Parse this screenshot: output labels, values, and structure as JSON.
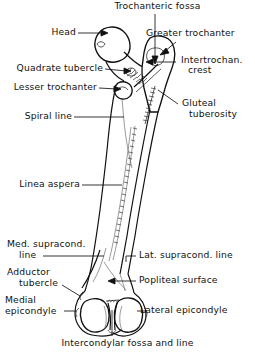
{
  "figure": {
    "view": "posterior",
    "ink_color": "#111111",
    "background_color": "#ffffff"
  },
  "labels": {
    "trochanteric_fossa": "Trochanteric fossa",
    "head": "Head",
    "greater_trochanter": "Greater trochanter",
    "quadrate_tubercle": "Quadrate tubercle",
    "intertrochanteric_crest_l1": "Intertrochan.",
    "intertrochanteric_crest_l2": "crest",
    "lesser_trochanter": "Lesser trochanter",
    "spiral_line": "Spiral line",
    "gluteal_tuberosity_l1": "Gluteal",
    "gluteal_tuberosity_l2": "tuberosity",
    "linea_aspera": "Linea aspera",
    "med_supracondylar_line_l1": "Med. supracond.",
    "med_supracondylar_line_l2": "line",
    "lat_supracondylar_line": "Lat. supracond. line",
    "adductor_tubercle_l1": "Adductor",
    "adductor_tubercle_l2": "tubercle",
    "popliteal_surface": "Popliteal surface",
    "medial_epicondyle_l1": "Medial",
    "medial_epicondyle_l2": "epicondyle",
    "lateral_epicondyle": "Lateral epicondyle",
    "intercondylar_fossa_and_line": "Intercondylar fossa and line"
  }
}
